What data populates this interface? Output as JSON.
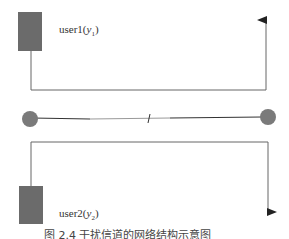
{
  "diagram": {
    "user1": {
      "name": "user1",
      "var": "y",
      "sub": "1"
    },
    "user2": {
      "name": "user2",
      "var": "y",
      "sub": "2"
    },
    "colors": {
      "block": "#6b6b6b",
      "node": "#7a7a7a",
      "line": "#555555"
    }
  },
  "caption": "图 2.4  干扰信道的网络结构示意图"
}
